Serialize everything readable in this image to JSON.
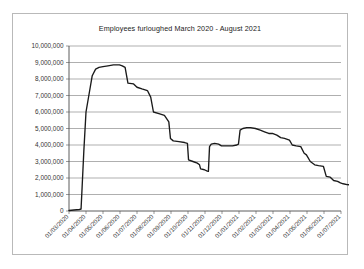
{
  "chart_data": {
    "type": "line",
    "title": "Employees furloughed March 2020 - August 2021",
    "xlabel": "",
    "ylabel": "",
    "ylim": [
      0,
      10000000
    ],
    "grid": true,
    "legend": "none",
    "ytick_labels": [
      "10,000,000",
      "9,000,000",
      "8,000,000",
      "7,000,000",
      "6,000,000",
      "5,000,000",
      "4,000,000",
      "3,000,000",
      "2,000,000",
      "1,000,000",
      "0"
    ],
    "ytick_values": [
      10000000,
      9000000,
      8000000,
      7000000,
      6000000,
      5000000,
      4000000,
      3000000,
      2000000,
      1000000,
      0
    ],
    "xtick_labels": [
      "01/03/2020",
      "01/04/2020",
      "01/05/2020",
      "01/06/2020",
      "01/07/2020",
      "01/08/2020",
      "01/09/2020",
      "01/10/2020",
      "01/11/2020",
      "01/12/2020",
      "01/01/2021",
      "01/02/2021",
      "01/03/2021",
      "01/04/2021",
      "01/05/2021",
      "01/06/2021",
      "01/07/2021"
    ],
    "series": [
      {
        "name": "Employees furloughed",
        "points": [
          {
            "x": "01/03/2020",
            "y": 30000
          },
          {
            "x": "10/03/2020",
            "y": 60000
          },
          {
            "x": "20/03/2020",
            "y": 90000
          },
          {
            "x": "23/03/2020",
            "y": 120000
          },
          {
            "x": "25/03/2020",
            "y": 1500000
          },
          {
            "x": "28/03/2020",
            "y": 3600000
          },
          {
            "x": "01/04/2020",
            "y": 6000000
          },
          {
            "x": "06/04/2020",
            "y": 7000000
          },
          {
            "x": "12/04/2020",
            "y": 8200000
          },
          {
            "x": "18/04/2020",
            "y": 8600000
          },
          {
            "x": "24/04/2020",
            "y": 8700000
          },
          {
            "x": "01/05/2020",
            "y": 8750000
          },
          {
            "x": "10/05/2020",
            "y": 8800000
          },
          {
            "x": "20/05/2020",
            "y": 8860000
          },
          {
            "x": "31/05/2020",
            "y": 8860000
          },
          {
            "x": "05/06/2020",
            "y": 8800000
          },
          {
            "x": "10/06/2020",
            "y": 8700000
          },
          {
            "x": "15/06/2020",
            "y": 7750000
          },
          {
            "x": "25/06/2020",
            "y": 7700000
          },
          {
            "x": "01/07/2020",
            "y": 7500000
          },
          {
            "x": "10/07/2020",
            "y": 7400000
          },
          {
            "x": "20/07/2020",
            "y": 7300000
          },
          {
            "x": "26/07/2020",
            "y": 6900000
          },
          {
            "x": "31/07/2020",
            "y": 6000000
          },
          {
            "x": "10/08/2020",
            "y": 5900000
          },
          {
            "x": "20/08/2020",
            "y": 5800000
          },
          {
            "x": "28/08/2020",
            "y": 5400000
          },
          {
            "x": "31/08/2020",
            "y": 4400000
          },
          {
            "x": "05/09/2020",
            "y": 4250000
          },
          {
            "x": "15/09/2020",
            "y": 4200000
          },
          {
            "x": "25/09/2020",
            "y": 4150000
          },
          {
            "x": "30/09/2020",
            "y": 4100000
          },
          {
            "x": "02/10/2020",
            "y": 3100000
          },
          {
            "x": "10/10/2020",
            "y": 3000000
          },
          {
            "x": "18/10/2020",
            "y": 2900000
          },
          {
            "x": "22/10/2020",
            "y": 2800000
          },
          {
            "x": "24/10/2020",
            "y": 2550000
          },
          {
            "x": "31/10/2020",
            "y": 2500000
          },
          {
            "x": "05/11/2020",
            "y": 2420000
          },
          {
            "x": "07/11/2020",
            "y": 2400000
          },
          {
            "x": "09/11/2020",
            "y": 3900000
          },
          {
            "x": "12/11/2020",
            "y": 4050000
          },
          {
            "x": "18/11/2020",
            "y": 4100000
          },
          {
            "x": "25/11/2020",
            "y": 4050000
          },
          {
            "x": "30/11/2020",
            "y": 3950000
          },
          {
            "x": "10/12/2020",
            "y": 3950000
          },
          {
            "x": "20/12/2020",
            "y": 3950000
          },
          {
            "x": "28/12/2020",
            "y": 4000000
          },
          {
            "x": "31/12/2020",
            "y": 4050000
          },
          {
            "x": "03/01/2021",
            "y": 4900000
          },
          {
            "x": "08/01/2021",
            "y": 5000000
          },
          {
            "x": "15/01/2021",
            "y": 5050000
          },
          {
            "x": "22/01/2021",
            "y": 5050000
          },
          {
            "x": "31/01/2021",
            "y": 5000000
          },
          {
            "x": "08/02/2021",
            "y": 4900000
          },
          {
            "x": "15/02/2021",
            "y": 4800000
          },
          {
            "x": "22/02/2021",
            "y": 4700000
          },
          {
            "x": "28/02/2021",
            "y": 4700000
          },
          {
            "x": "08/03/2021",
            "y": 4600000
          },
          {
            "x": "15/03/2021",
            "y": 4450000
          },
          {
            "x": "22/03/2021",
            "y": 4400000
          },
          {
            "x": "31/03/2021",
            "y": 4300000
          },
          {
            "x": "05/04/2021",
            "y": 4000000
          },
          {
            "x": "12/04/2021",
            "y": 3950000
          },
          {
            "x": "20/04/2021",
            "y": 3900000
          },
          {
            "x": "26/04/2021",
            "y": 3500000
          },
          {
            "x": "30/04/2021",
            "y": 3400000
          },
          {
            "x": "07/05/2021",
            "y": 3000000
          },
          {
            "x": "15/05/2021",
            "y": 2800000
          },
          {
            "x": "22/05/2021",
            "y": 2750000
          },
          {
            "x": "31/05/2021",
            "y": 2700000
          },
          {
            "x": "05/06/2021",
            "y": 2100000
          },
          {
            "x": "12/06/2021",
            "y": 2050000
          },
          {
            "x": "18/06/2021",
            "y": 1850000
          },
          {
            "x": "25/06/2021",
            "y": 1800000
          },
          {
            "x": "30/06/2021",
            "y": 1700000
          },
          {
            "x": "05/07/2021",
            "y": 1650000
          },
          {
            "x": "12/07/2021",
            "y": 1600000
          },
          {
            "x": "20/07/2021",
            "y": 1580000
          },
          {
            "x": "27/07/2021",
            "y": 1560000
          }
        ]
      }
    ]
  }
}
